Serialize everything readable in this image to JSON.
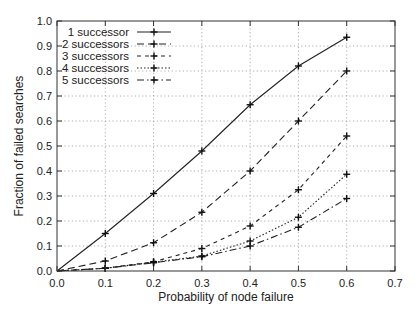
{
  "chart_data": {
    "type": "line",
    "title": "",
    "xlabel": "Probability of node failure",
    "ylabel": "Fraction of failed searches",
    "xlim": [
      0.0,
      0.7
    ],
    "ylim": [
      0.0,
      1.0
    ],
    "xticks": [
      "0.0",
      "0.1",
      "0.2",
      "0.3",
      "0.4",
      "0.5",
      "0.6",
      "0.7"
    ],
    "yticks": [
      "0.0",
      "0.1",
      "0.2",
      "0.3",
      "0.4",
      "0.5",
      "0.6",
      "0.7",
      "0.8",
      "0.9",
      "1.0"
    ],
    "grid": true,
    "legend_position": "upper left",
    "x": [
      0.0,
      0.1,
      0.2,
      0.3,
      0.4,
      0.5,
      0.6
    ],
    "series": [
      {
        "name": "1 successor",
        "style": "solid",
        "values": [
          0.0,
          0.15,
          0.31,
          0.48,
          0.665,
          0.82,
          0.935
        ]
      },
      {
        "name": "2 successors",
        "style": "dashed",
        "values": [
          0.0,
          0.04,
          0.113,
          0.235,
          0.4,
          0.6,
          0.8
        ]
      },
      {
        "name": "3 successors",
        "style": "short-dashed",
        "values": [
          0.0,
          0.011,
          0.037,
          0.09,
          0.18,
          0.325,
          0.54
        ]
      },
      {
        "name": "4 successors",
        "style": "dotted",
        "values": [
          0.0,
          0.011,
          0.035,
          0.06,
          0.12,
          0.215,
          0.387
        ]
      },
      {
        "name": "5 successors",
        "style": "dash-dot",
        "values": [
          0.0,
          0.011,
          0.033,
          0.057,
          0.1,
          0.175,
          0.29
        ]
      }
    ]
  }
}
